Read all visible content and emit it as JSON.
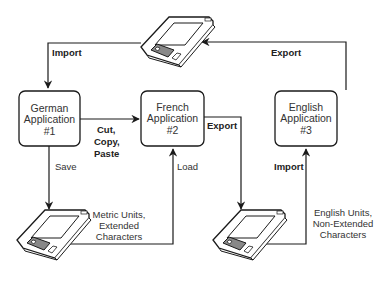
{
  "diagram": {
    "nodes": {
      "german": {
        "line1": "German",
        "line2": "Application",
        "line3": "#1"
      },
      "french": {
        "line1": "French",
        "line2": "Application",
        "line3": "#2"
      },
      "english": {
        "line1": "English",
        "line2": "Application",
        "line3": "#3"
      }
    },
    "disks": {
      "top": {
        "icon": "floppy-disk-icon"
      },
      "metric": {
        "icon": "floppy-disk-icon",
        "note_line1": "Metric Units,",
        "note_line2": "Extended",
        "note_line3": "Characters"
      },
      "english_units": {
        "icon": "floppy-disk-icon",
        "note_line1": "English Units,",
        "note_line2": "Non-Extended",
        "note_line3": "Characters"
      }
    },
    "edges": {
      "import_top": "Import",
      "export_top": "Export",
      "cut_line1": "Cut,",
      "cut_line2": "Copy,",
      "cut_line3": "Paste",
      "export_french": "Export",
      "save": "Save",
      "load": "Load",
      "import_english": "Import"
    },
    "colors": {
      "stroke": "#1a1a1a",
      "text": "#333333",
      "shutter": "#888888",
      "background": "#ffffff"
    }
  }
}
